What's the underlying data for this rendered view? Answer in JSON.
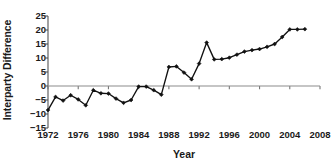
{
  "chart_data": {
    "type": "line",
    "title": "",
    "xlabel": "Year",
    "ylabel": "Interparty Difference",
    "xlim": [
      1972,
      2008
    ],
    "ylim": [
      -15,
      25
    ],
    "grid": false,
    "legend": null,
    "marker": "diamond",
    "line_color": "#111111",
    "zero_line": true,
    "zero_line_color": "#8c8c8c",
    "xticks": [
      1972,
      1976,
      1980,
      1984,
      1988,
      1992,
      1996,
      2000,
      2004,
      2008
    ],
    "xtick_labels": [
      "1972",
      "1976",
      "1980",
      "1984",
      "1988",
      "1992",
      "1996",
      "2000",
      "2004",
      "2008"
    ],
    "yticks": [
      25,
      20,
      15,
      10,
      5,
      0,
      -5,
      -10,
      -15
    ],
    "ytick_labels": [
      "25",
      "20",
      "15",
      "10",
      "5",
      "0",
      "−5",
      "−10",
      "−15"
    ],
    "x": [
      1972,
      1973,
      1974,
      1975,
      1976,
      1977,
      1978,
      1979,
      1980,
      1981,
      1982,
      1983,
      1984,
      1985,
      1986,
      1987,
      1988,
      1989,
      1990,
      1991,
      1992,
      1993,
      1994,
      1995,
      1996,
      1997,
      1998,
      1999,
      2000,
      2001,
      2002,
      2003,
      2004,
      2005,
      2006
    ],
    "values": [
      -8.6,
      -3.9,
      -5.2,
      -3.3,
      -4.8,
      -6.9,
      -1.5,
      -2.6,
      -2.7,
      -4.5,
      -6.0,
      -5.0,
      -0.2,
      -0.2,
      -1.5,
      -3.1,
      6.8,
      7.0,
      4.8,
      2.4,
      8.0,
      15.5,
      9.5,
      9.6,
      10.1,
      11.2,
      12.3,
      12.8,
      13.2,
      14.0,
      15.0,
      17.5,
      20.2,
      20.2,
      20.3
    ],
    "series_name": "Interparty Difference"
  },
  "axes": {
    "y_axis_name": "y-axis",
    "x_axis_name": "x-axis"
  }
}
